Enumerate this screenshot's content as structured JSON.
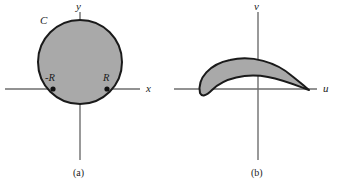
{
  "figure": {
    "background_color": "#ffffff",
    "shade_color": "#a9a9a9",
    "outline_color": "#1a1a1a",
    "axis_color": "#6e6e6e",
    "text_color": "#1c1c1c"
  },
  "panels": [
    {
      "id": "a",
      "caption": "(a)",
      "axes": {
        "horizontal_label": "x",
        "vertical_label": "y"
      },
      "region": {
        "label": "C",
        "shape": "filled-circle",
        "center": {
          "x": 80,
          "y": 62
        },
        "radius": 42
      },
      "marked_points": [
        {
          "label": "-R",
          "x": 53,
          "y": 89
        },
        {
          "label": "R",
          "x": 107,
          "y": 89
        }
      ]
    },
    {
      "id": "b",
      "caption": "(b)",
      "axes": {
        "horizontal_label": "u",
        "vertical_label": "v"
      },
      "region": {
        "label": "",
        "shape": "crescent",
        "description": "crescent-shaped shaded image region with a cusp on the u-axis at right"
      },
      "marked_points": []
    }
  ]
}
